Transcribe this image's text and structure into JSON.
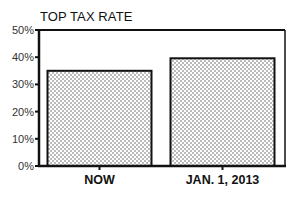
{
  "chart_data": {
    "type": "bar",
    "title": "TOP TAX RATE",
    "xlabel": "",
    "ylabel": "",
    "categories": [
      "NOW",
      "JAN. 1, 2013"
    ],
    "values": [
      35,
      39.6
    ],
    "unit": "%",
    "ylim": [
      0,
      50
    ],
    "yticks": [
      0,
      10,
      20,
      30,
      40,
      50
    ],
    "ytick_labels": [
      "0%",
      "10%",
      "20%",
      "30%",
      "40%",
      "50%"
    ],
    "grid": false,
    "legend": null,
    "bar_fill": "dotted pattern",
    "colors": {
      "bar_border": "#111111",
      "dots": "#555555",
      "background": "#ffffff"
    }
  }
}
